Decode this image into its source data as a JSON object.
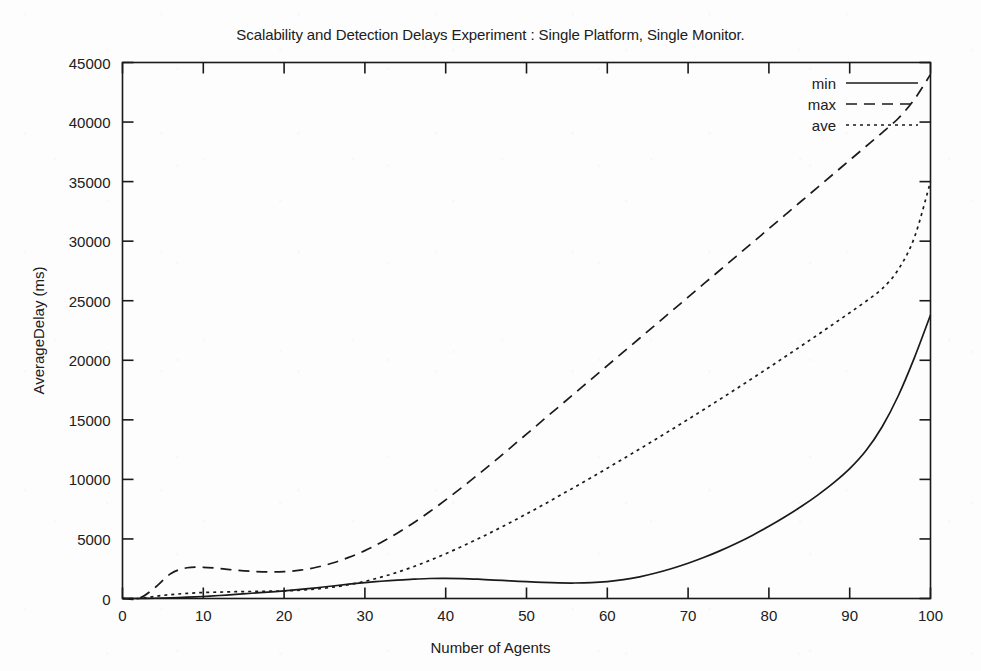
{
  "chart_data": {
    "type": "line",
    "title": "Scalability and Detection Delays Experiment : Single Platform, Single Monitor.",
    "xlabel": "Number of Agents",
    "ylabel": "AverageDelay (ms)",
    "xlim": [
      0,
      100
    ],
    "ylim": [
      0,
      45000
    ],
    "xticks": [
      0,
      10,
      20,
      30,
      40,
      50,
      60,
      70,
      80,
      90,
      100
    ],
    "yticks": [
      0,
      5000,
      10000,
      15000,
      20000,
      25000,
      30000,
      35000,
      40000,
      45000
    ],
    "xtick_labels": [
      "0",
      "10",
      "20",
      "30",
      "40",
      "50",
      "60",
      "70",
      "80",
      "90",
      "100"
    ],
    "ytick_labels": [
      "0",
      "5000",
      "10000",
      "15000",
      "20000",
      "25000",
      "30000",
      "35000",
      "40000",
      "45000"
    ],
    "grid": false,
    "legend_position": "top-right",
    "x": [
      0,
      2,
      4,
      6,
      8,
      10,
      12,
      14,
      16,
      18,
      20,
      22,
      24,
      26,
      28,
      30,
      32,
      34,
      36,
      38,
      40,
      42,
      44,
      46,
      48,
      50,
      52,
      54,
      56,
      58,
      60,
      62,
      64,
      66,
      68,
      70,
      72,
      74,
      76,
      78,
      80,
      82,
      84,
      86,
      88,
      90,
      92,
      94,
      96,
      98,
      100
    ],
    "series": [
      {
        "name": "min",
        "style": "solid",
        "values": [
          0,
          0,
          20,
          60,
          110,
          170,
          250,
          340,
          440,
          540,
          640,
          760,
          900,
          1050,
          1200,
          1330,
          1450,
          1550,
          1620,
          1680,
          1690,
          1670,
          1620,
          1550,
          1480,
          1410,
          1350,
          1310,
          1300,
          1330,
          1420,
          1580,
          1820,
          2140,
          2520,
          2960,
          3460,
          4020,
          4640,
          5320,
          6060,
          6860,
          7720,
          8660,
          9700,
          10900,
          12400,
          14400,
          17000,
          20200,
          23800
        ]
      },
      {
        "name": "max",
        "style": "dashed",
        "values": [
          0,
          0,
          900,
          2100,
          2580,
          2620,
          2520,
          2380,
          2280,
          2230,
          2250,
          2380,
          2620,
          2980,
          3450,
          4020,
          4700,
          5480,
          6340,
          7280,
          8280,
          9320,
          10400,
          11500,
          12650,
          13800,
          14950,
          16100,
          17250,
          18400,
          19550,
          20700,
          21850,
          23000,
          24150,
          25300,
          26450,
          27600,
          28750,
          29900,
          31050,
          32200,
          33350,
          34500,
          35650,
          36800,
          37950,
          39100,
          40300,
          41900,
          44000
        ]
      },
      {
        "name": "ave",
        "style": "dotted",
        "values": [
          0,
          0,
          180,
          330,
          430,
          500,
          540,
          570,
          590,
          610,
          640,
          700,
          800,
          950,
          1160,
          1440,
          1790,
          2200,
          2670,
          3190,
          3760,
          4370,
          5010,
          5680,
          6380,
          7100,
          7840,
          8600,
          9370,
          10150,
          10940,
          11740,
          12550,
          13370,
          14200,
          15040,
          15890,
          16750,
          17620,
          18500,
          19390,
          20290,
          21200,
          22120,
          23050,
          23990,
          24950,
          26000,
          27600,
          30300,
          35000
        ]
      }
    ],
    "legend": [
      {
        "label": "min",
        "style": "solid"
      },
      {
        "label": "max",
        "style": "dashed"
      },
      {
        "label": "ave",
        "style": "dotted"
      }
    ]
  }
}
